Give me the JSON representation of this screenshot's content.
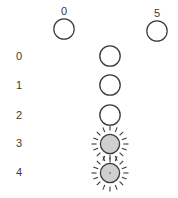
{
  "figure": {
    "width": 178,
    "height": 198,
    "background": "#ffffff",
    "stroke_color": "#3a3a3a",
    "fill_empty": "#ffffff",
    "fill_active": "#cfcfcf",
    "text_color": "#3a3a3a"
  },
  "column_headers": [
    {
      "label": "0",
      "x": 64,
      "label_y": 6,
      "circle_cx": 64,
      "circle_cy": 29,
      "r": 11,
      "state": "empty"
    },
    {
      "label": "5",
      "x": 157,
      "label_y": 8,
      "circle_cx": 157,
      "circle_cy": 31,
      "r": 11,
      "state": "empty"
    }
  ],
  "row_labels": [
    {
      "label": "0",
      "y": 51
    },
    {
      "label": "1",
      "y": 80
    },
    {
      "label": "2",
      "y": 110
    },
    {
      "label": "3",
      "y": 138
    },
    {
      "label": "4",
      "y": 167
    }
  ],
  "cells": [
    {
      "row": "0",
      "cx": 110,
      "cy": 56,
      "r": 11,
      "state": "empty",
      "icon": "open-circle"
    },
    {
      "row": "1",
      "cx": 110,
      "cy": 85,
      "r": 11,
      "state": "empty",
      "icon": "open-circle"
    },
    {
      "row": "2",
      "cx": 110,
      "cy": 115,
      "r": 11,
      "state": "empty",
      "icon": "open-circle"
    },
    {
      "row": "3",
      "cx": 110,
      "cy": 144,
      "r": 11,
      "state": "active",
      "icon": "sun-burst",
      "rays": 16,
      "center_dot": false
    },
    {
      "row": "4",
      "cx": 110,
      "cy": 173,
      "r": 11,
      "state": "active",
      "icon": "sun-burst",
      "rays": 16,
      "center_dot": true
    }
  ]
}
